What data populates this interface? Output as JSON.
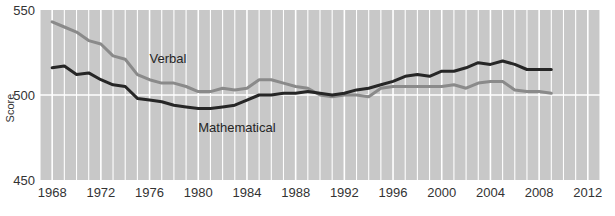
{
  "chart_data": {
    "type": "line",
    "title": "",
    "xlabel": "",
    "ylabel": "Score",
    "xlim": [
      1967,
      2013
    ],
    "ylim": [
      450,
      550
    ],
    "grid": "vertical-white-yearly",
    "legend_position": "inline-annotations",
    "y_ticks": [
      450,
      500,
      550
    ],
    "x_ticks": [
      1968,
      1972,
      1976,
      1980,
      1984,
      1988,
      1992,
      1996,
      2000,
      2004,
      2008,
      2012
    ],
    "x": [
      1968,
      1969,
      1970,
      1971,
      1972,
      1973,
      1974,
      1975,
      1976,
      1977,
      1978,
      1979,
      1980,
      1981,
      1982,
      1983,
      1984,
      1985,
      1986,
      1987,
      1988,
      1989,
      1990,
      1991,
      1992,
      1993,
      1994,
      1995,
      1996,
      1997,
      1998,
      1999,
      2000,
      2001,
      2002,
      2003,
      2004,
      2005,
      2006,
      2007,
      2008,
      2009
    ],
    "series": [
      {
        "name": "Verbal",
        "color": "#8a8a8a",
        "values": [
          543,
          540,
          537,
          532,
          530,
          523,
          521,
          512,
          509,
          507,
          507,
          505,
          502,
          502,
          504,
          503,
          504,
          509,
          509,
          507,
          505,
          504,
          500,
          499,
          500,
          500,
          499,
          504,
          505,
          505,
          505,
          505,
          505,
          506,
          504,
          507,
          508,
          508,
          503,
          502,
          502,
          501
        ]
      },
      {
        "name": "Mathematical",
        "color": "#262626",
        "values": [
          516,
          517,
          512,
          513,
          509,
          506,
          505,
          498,
          497,
          496,
          494,
          493,
          492,
          492,
          493,
          494,
          497,
          500,
          500,
          501,
          501,
          502,
          501,
          500,
          501,
          503,
          504,
          506,
          508,
          511,
          512,
          511,
          514,
          514,
          516,
          519,
          518,
          520,
          518,
          515,
          515,
          515
        ]
      }
    ],
    "annotations": [
      {
        "text": "Verbal",
        "x": 1976,
        "y": 519
      },
      {
        "text": "Mathematical",
        "x": 1980,
        "y": 478
      }
    ],
    "colors": {
      "plot_background": "#c8c8c8",
      "gridline": "#ffffff",
      "page_background": "#ffffff",
      "tick_label": "#333333"
    }
  }
}
